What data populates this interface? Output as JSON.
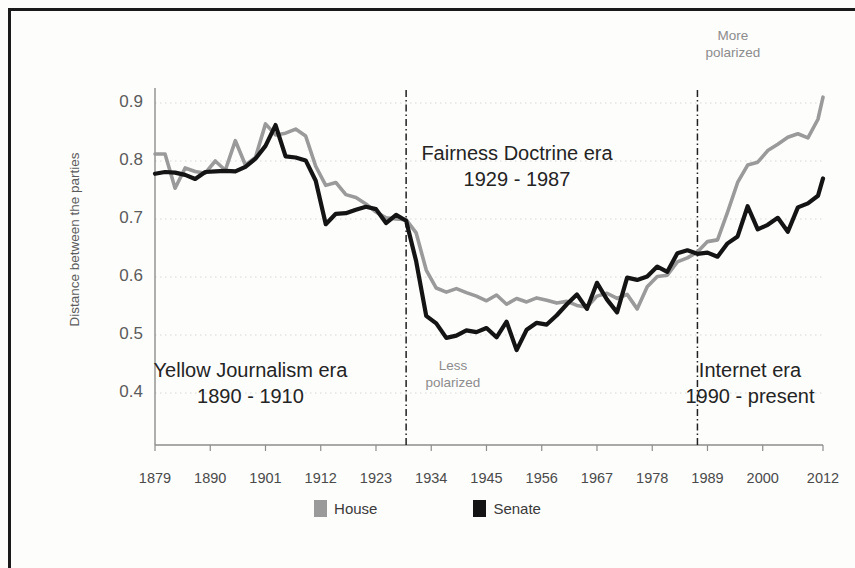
{
  "chart_data": {
    "type": "line",
    "title": "",
    "xlabel": "",
    "ylabel": "Distance between the parties",
    "xlim": [
      1879,
      2012
    ],
    "ylim": [
      0.38,
      0.93
    ],
    "yticks": [
      "0.4",
      "0.5",
      "0.6",
      "0.7",
      "0.8",
      "0.9"
    ],
    "ytick_values": [
      0.4,
      0.5,
      0.6,
      0.7,
      0.8,
      0.9
    ],
    "xticks": [
      "1879",
      "1890",
      "1901",
      "1912",
      "1923",
      "1934",
      "1945",
      "1956",
      "1967",
      "1978",
      "1989",
      "2000",
      "2012"
    ],
    "xtick_values": [
      1879,
      1890,
      1901,
      1912,
      1923,
      1934,
      1945,
      1956,
      1967,
      1978,
      1989,
      2000,
      2012
    ],
    "grid": true,
    "legend_position": "bottom",
    "series": [
      {
        "name": "House",
        "color": "#9a9a9a",
        "x": [
          1879,
          1881,
          1883,
          1885,
          1887,
          1889,
          1891,
          1893,
          1895,
          1897,
          1899,
          1901,
          1903,
          1905,
          1907,
          1909,
          1911,
          1913,
          1915,
          1917,
          1919,
          1921,
          1923,
          1925,
          1927,
          1929,
          1931,
          1933,
          1935,
          1937,
          1939,
          1941,
          1943,
          1945,
          1947,
          1949,
          1951,
          1953,
          1955,
          1957,
          1959,
          1961,
          1963,
          1965,
          1967,
          1969,
          1971,
          1973,
          1975,
          1977,
          1979,
          1981,
          1983,
          1985,
          1987,
          1989,
          1991,
          1993,
          1995,
          1997,
          1999,
          2001,
          2003,
          2005,
          2007,
          2009,
          2011,
          2012
        ],
        "y": [
          0.812,
          0.812,
          0.753,
          0.788,
          0.782,
          0.779,
          0.8,
          0.784,
          0.835,
          0.793,
          0.806,
          0.864,
          0.845,
          0.848,
          0.855,
          0.843,
          0.791,
          0.758,
          0.763,
          0.742,
          0.737,
          0.726,
          0.712,
          0.702,
          0.7,
          0.699,
          0.676,
          0.612,
          0.581,
          0.574,
          0.58,
          0.573,
          0.567,
          0.559,
          0.569,
          0.553,
          0.563,
          0.557,
          0.564,
          0.56,
          0.555,
          0.558,
          0.551,
          0.548,
          0.567,
          0.572,
          0.563,
          0.57,
          0.545,
          0.583,
          0.601,
          0.603,
          0.626,
          0.633,
          0.643,
          0.661,
          0.664,
          0.712,
          0.763,
          0.793,
          0.798,
          0.818,
          0.829,
          0.841,
          0.847,
          0.84,
          0.872,
          0.91
        ]
      },
      {
        "name": "Senate",
        "color": "#141414",
        "x": [
          1879,
          1881,
          1883,
          1885,
          1887,
          1889,
          1891,
          1893,
          1895,
          1897,
          1899,
          1901,
          1903,
          1905,
          1907,
          1909,
          1911,
          1913,
          1915,
          1917,
          1919,
          1921,
          1923,
          1925,
          1927,
          1929,
          1931,
          1933,
          1935,
          1937,
          1939,
          1941,
          1943,
          1945,
          1947,
          1949,
          1951,
          1953,
          1955,
          1957,
          1959,
          1961,
          1963,
          1965,
          1967,
          1969,
          1971,
          1973,
          1975,
          1977,
          1979,
          1981,
          1983,
          1985,
          1987,
          1989,
          1991,
          1993,
          1995,
          1997,
          1999,
          2001,
          2003,
          2005,
          2007,
          2009,
          2011,
          2012
        ],
        "y": [
          0.778,
          0.781,
          0.78,
          0.776,
          0.769,
          0.781,
          0.782,
          0.783,
          0.782,
          0.79,
          0.804,
          0.826,
          0.862,
          0.808,
          0.806,
          0.801,
          0.766,
          0.691,
          0.709,
          0.71,
          0.716,
          0.721,
          0.717,
          0.693,
          0.707,
          0.697,
          0.627,
          0.533,
          0.52,
          0.495,
          0.499,
          0.508,
          0.505,
          0.512,
          0.496,
          0.523,
          0.474,
          0.509,
          0.521,
          0.518,
          0.534,
          0.553,
          0.57,
          0.545,
          0.59,
          0.561,
          0.539,
          0.599,
          0.595,
          0.601,
          0.618,
          0.609,
          0.641,
          0.646,
          0.64,
          0.642,
          0.635,
          0.658,
          0.67,
          0.722,
          0.682,
          0.69,
          0.702,
          0.678,
          0.72,
          0.727,
          0.74,
          0.77
        ]
      }
    ],
    "dividers": [
      {
        "name": "fairness-doctrine-start",
        "x": 1929
      },
      {
        "name": "fairness-doctrine-end",
        "x": 1987
      }
    ],
    "annotations": [
      {
        "id": "more_polarized",
        "line1": "More",
        "line2": "polarized"
      },
      {
        "id": "less_polarized",
        "line1": "Less",
        "line2": "polarized"
      },
      {
        "id": "yellow_journalism",
        "line1": "Yellow Journalism era",
        "line2": "1890 - 1910"
      },
      {
        "id": "fairness_doctrine",
        "line1": "Fairness Doctrine era",
        "line2": "1929 - 1987"
      },
      {
        "id": "internet",
        "line1": "Internet era",
        "line2": "1990 - present"
      }
    ]
  },
  "axis": {
    "y_title": "Distance between the parties"
  },
  "legend": {
    "items": [
      {
        "label": "House",
        "color": "#9a9a9a"
      },
      {
        "label": "Senate",
        "color": "#141414"
      }
    ]
  },
  "colors": {
    "house": "#9a9a9a",
    "senate": "#141414",
    "annotation_dark": "#242424",
    "annotation_gray": "#8c8c8c",
    "axis": "#8d8d8d",
    "border": "#1a1a1a"
  }
}
